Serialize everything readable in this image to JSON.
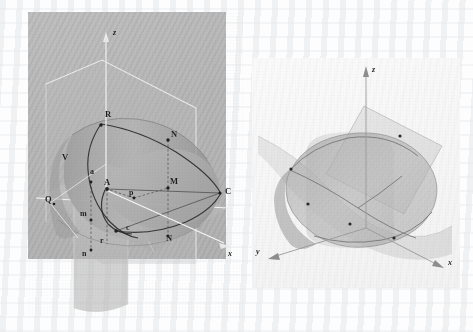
{
  "page": {
    "background_color": "#fdfdfd",
    "figure_count": 2,
    "faint_bleed_text_top": ""
  },
  "figures": [
    {
      "id": "left-figure",
      "name": "cone-plane-intersection-labeled",
      "background_color": "#b6b6b6",
      "axes": [
        {
          "name": "z-axis",
          "label": "z",
          "direction": "up"
        },
        {
          "name": "x-axis",
          "label": "x",
          "direction": "lower-right"
        }
      ],
      "point_labels": [
        {
          "text": "R",
          "x": 77,
          "y": 104,
          "style": "cap"
        },
        {
          "text": "N",
          "x": 143,
          "y": 124,
          "style": "cap"
        },
        {
          "text": "V",
          "x": 35,
          "y": 146,
          "style": "cap"
        },
        {
          "text": "a",
          "x": 63,
          "y": 161,
          "style": "low"
        },
        {
          "text": "A",
          "x": 76,
          "y": 171,
          "style": "cap"
        },
        {
          "text": "M",
          "x": 142,
          "y": 170,
          "style": "cap"
        },
        {
          "text": "C",
          "x": 198,
          "y": 180,
          "style": "cap"
        },
        {
          "text": "Q",
          "x": 19,
          "y": 187,
          "style": "cap"
        },
        {
          "text": "p",
          "x": 101,
          "y": 182,
          "style": "low"
        },
        {
          "text": "m",
          "x": 60,
          "y": 202,
          "style": "low"
        },
        {
          "text": "c",
          "x": 99,
          "y": 217,
          "style": "low"
        },
        {
          "text": "N",
          "x": 138,
          "y": 227,
          "style": "cap"
        },
        {
          "text": "r",
          "x": 74,
          "y": 229,
          "style": "low"
        },
        {
          "text": "n",
          "x": 60,
          "y": 243,
          "style": "low"
        }
      ]
    },
    {
      "id": "right-figure",
      "name": "cone-plane-intersection-unlabeled",
      "background_color": "#f7f7f7",
      "axes": [
        {
          "name": "z-axis",
          "label": "z",
          "direction": "up"
        },
        {
          "name": "y-axis",
          "label": "y",
          "direction": "lower-left"
        },
        {
          "name": "x-axis",
          "label": "x",
          "direction": "lower-right"
        }
      ],
      "point_labels": []
    }
  ],
  "colors": {
    "left_plate": "#b6b6b6",
    "right_plate": "#f7f7f7",
    "axis_light": "#f4f4f4",
    "axis_dark": "#6e6e6e",
    "curve_dark": "#2b2b2b",
    "surface_fill": "#9a9a9a",
    "plane_fill": "#c9c9c9",
    "label_text": "#1d1d1d"
  }
}
